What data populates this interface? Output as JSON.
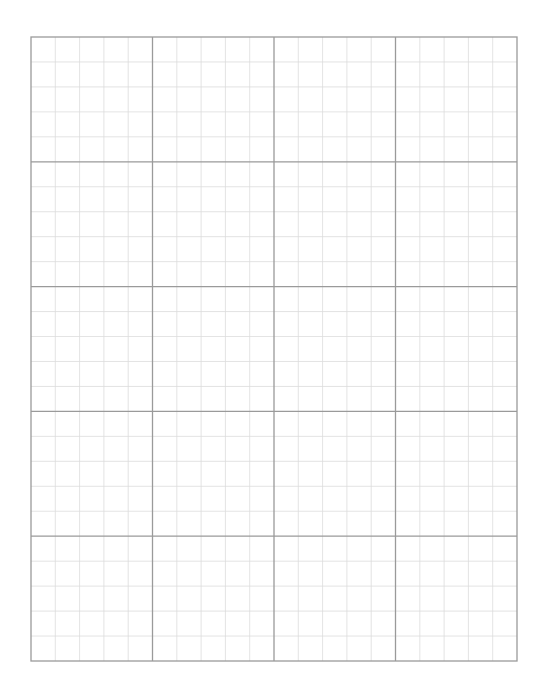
{
  "page": {
    "width": 549,
    "height": 700,
    "background": "#ffffff"
  },
  "graph_paper": {
    "left": 31,
    "top": 37,
    "right": 517,
    "bottom": 661,
    "major_columns": 4,
    "major_rows": 5,
    "minor_subdivisions": 5,
    "major_line_color": "#9a9a9a",
    "minor_line_color": "#dcdcdc",
    "border_color": "#9a9a9a",
    "major_line_width": 1.3,
    "minor_line_width": 0.8
  }
}
